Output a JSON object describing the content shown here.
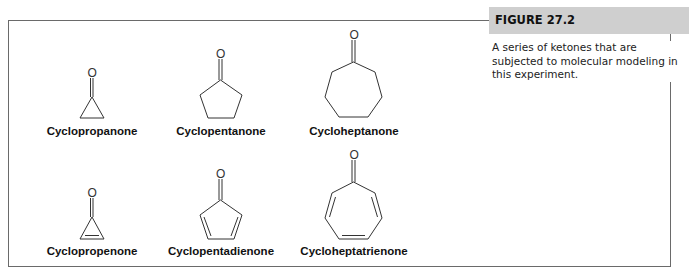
{
  "figure": {
    "number": "FIGURE 27.2",
    "caption": "A series of ketones that are subjected to molecular modeling in this experiment."
  },
  "molecules": [
    {
      "name": "Cyclopropanone",
      "ring_size": 3,
      "double_bonds": 0
    },
    {
      "name": "Cyclopentanone",
      "ring_size": 5,
      "double_bonds": 0
    },
    {
      "name": "Cycloheptanone",
      "ring_size": 7,
      "double_bonds": 0
    },
    {
      "name": "Cyclopropenone",
      "ring_size": 3,
      "double_bonds": 1
    },
    {
      "name": "Cyclopentadienone",
      "ring_size": 5,
      "double_bonds": 2
    },
    {
      "name": "Cycloheptatrienone",
      "ring_size": 7,
      "double_bonds": 3
    }
  ],
  "atom_label": "O"
}
